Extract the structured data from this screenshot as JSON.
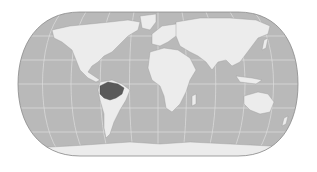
{
  "map": {
    "projection": "pseudocylindrical-rounded (Eckert IV-like)",
    "colors": {
      "background": "#ffffff",
      "ocean": "#b9b9b9",
      "land": "#ececec",
      "highlight": "#5a5a5a",
      "graticule": "#e2e2e2",
      "border": "#8a8a8a"
    },
    "highlighted_region": "Amazon basin (northern South America)",
    "labels": []
  }
}
